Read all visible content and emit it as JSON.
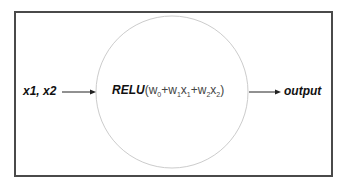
{
  "diagram": {
    "input_label": "x1, x2",
    "output_label": "output",
    "neuron": {
      "function": "RELU",
      "open_paren": "(",
      "close_paren": ")",
      "terms": [
        {
          "coef": "w",
          "coef_sub": "0",
          "var": "",
          "var_sub": "",
          "op": ""
        },
        {
          "coef": "w",
          "coef_sub": "1",
          "var": "x",
          "var_sub": "1",
          "op": "+"
        },
        {
          "coef": "w",
          "coef_sub": "2",
          "var": "x",
          "var_sub": "2",
          "op": "+"
        }
      ]
    },
    "colors": {
      "frame": "#4a4a4a",
      "circle": "#cccccc",
      "arrow": "#222222",
      "text": "#111111"
    }
  }
}
